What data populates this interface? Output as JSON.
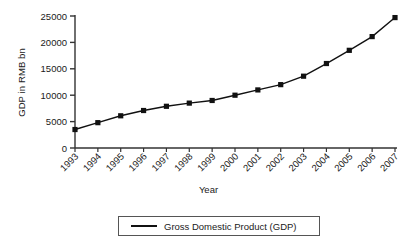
{
  "chart_data": {
    "type": "line",
    "title": "",
    "xlabel": "Year",
    "ylabel": "GDP in RMB bn",
    "categories": [
      "1993",
      "1994",
      "1995",
      "1996",
      "1997",
      "1998",
      "1999",
      "2000",
      "2001",
      "2002",
      "2003",
      "2004",
      "2005",
      "2006",
      "2007"
    ],
    "series": [
      {
        "name": "Gross Domestic Product (GDP)",
        "values": [
          3500,
          4800,
          6100,
          7100,
          7900,
          8500,
          9000,
          10000,
          11000,
          12000,
          13600,
          16000,
          18500,
          21100,
          24700
        ]
      }
    ],
    "ylim": [
      0,
      25000
    ],
    "yticks": [
      0,
      5000,
      10000,
      15000,
      20000,
      25000
    ],
    "ytick_labels": [
      "0",
      "5000",
      "10000",
      "15000",
      "20000",
      "25000"
    ],
    "grid": false,
    "legend_position": "bottom",
    "marker": "square",
    "line_color": "#111111",
    "marker_color": "#111111",
    "axis_color": "#333333",
    "background": "#ffffff"
  },
  "legend": {
    "entries": [
      {
        "label": "Gross Domestic Product (GDP)",
        "marker": "line-swatch"
      }
    ]
  },
  "axes": {
    "y_title": "GDP in RMB bn",
    "x_title": "Year"
  }
}
